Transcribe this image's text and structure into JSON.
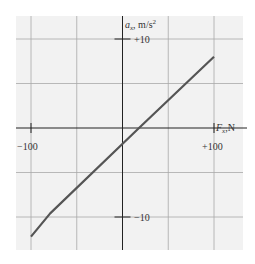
{
  "chart_data": {
    "type": "line",
    "title": "",
    "xlabel": "F_x, N",
    "ylabel": "a_x, m/s²",
    "xlim": [
      -120,
      130
    ],
    "ylim": [
      -13.7,
      12.6
    ],
    "grid": true,
    "x_ticks": [
      {
        "value": -100,
        "label": "−100"
      },
      {
        "value": 100,
        "label": "+100"
      }
    ],
    "y_ticks": [
      {
        "value": 10,
        "label": "+10"
      },
      {
        "value": -10,
        "label": "−10"
      }
    ],
    "grid_x": [
      -100,
      -50,
      0,
      50,
      100
    ],
    "grid_y": [
      -10,
      -5,
      0,
      5,
      10
    ],
    "series": [
      {
        "name": "a_x vs F_x",
        "color": "#555555",
        "x": [
          -100,
          -79,
          18,
          100
        ],
        "y": [
          -12.2,
          -9.6,
          0,
          8.0
        ]
      }
    ]
  },
  "labels": {
    "y_axis_var": "a",
    "y_axis_sub": "x",
    "y_axis_unit": ", m/s",
    "y_axis_exp": "2",
    "x_axis_var": "F",
    "x_axis_sub": "x",
    "x_axis_unit": ",N",
    "x_tick_neg": "−100",
    "x_tick_pos": "+100",
    "y_tick_pos": "+10",
    "y_tick_neg": "−10"
  }
}
